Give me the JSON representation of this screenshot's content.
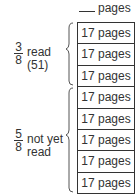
{
  "header": {
    "blank_label": "pages"
  },
  "rows": [
    "17 pages",
    "17 pages",
    "17 pages",
    "17 pages",
    "17 pages",
    "17 pages",
    "17 pages",
    "17 pages"
  ],
  "groups": [
    {
      "numerator": "3",
      "denominator": "8",
      "label_line1": "read",
      "label_line2": "(51)"
    },
    {
      "numerator": "5",
      "denominator": "8",
      "label_line1": "not yet",
      "label_line2": "read"
    }
  ]
}
